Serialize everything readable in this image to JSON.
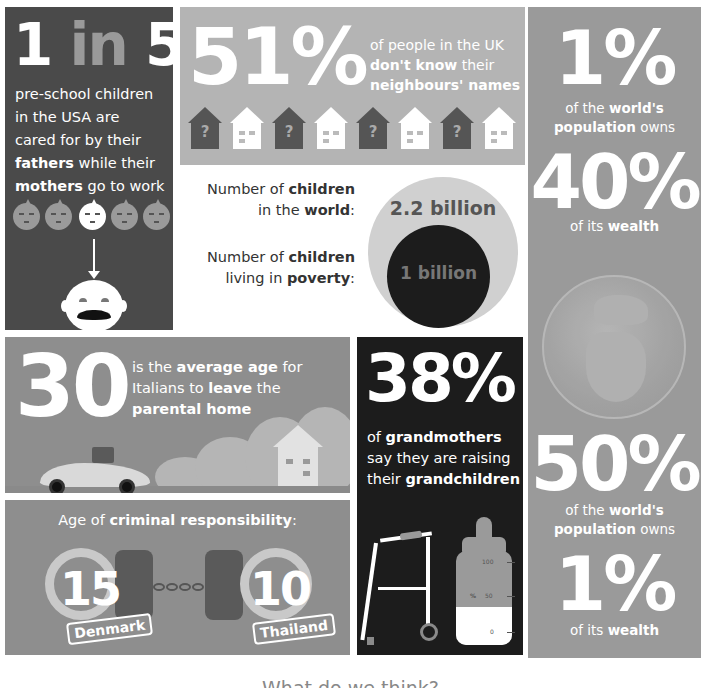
{
  "panel_1": {
    "stat_num1": "1",
    "stat_in": "in",
    "stat_num2": "5",
    "line1": "pre-school children",
    "line2": "in the USA are",
    "line3": "cared for by their",
    "bold_fathers": "fathers",
    "line4_rest": " while their",
    "bold_mothers": "mothers",
    "line5_rest": " go to work",
    "faces_total": 5,
    "highlighted_face_index": 2
  },
  "panel_2": {
    "stat": "51%",
    "line1": "of people in the UK",
    "bold_dont_know": "don't know",
    "line2_rest": " their",
    "bold_names": "neighbours' names",
    "question_mark": "?",
    "houses": [
      "unknown",
      "known",
      "unknown",
      "known",
      "unknown",
      "known",
      "unknown",
      "known"
    ]
  },
  "panel_3": {
    "label1_a": "Number of ",
    "label1_bold": "children",
    "label1_b": "in the ",
    "label1_bold2": "world",
    "label1_c": ":",
    "value1": "2.2 billion",
    "label2_a": "Number of ",
    "label2_bold": "children",
    "label2_b": "living in ",
    "label2_bold2": "poverty",
    "label2_c": ":",
    "value2": "1 billion"
  },
  "panel_4": {
    "stat_a": "1%",
    "cap_a1_pre": "of the ",
    "cap_a1_bold": "world's",
    "cap_a2_bold": "population",
    "cap_a2_post": " owns",
    "stat_b": "40%",
    "cap_b_pre": "of its ",
    "cap_b_bold": "wealth",
    "stat_c": "50%",
    "cap_c1_pre": "of the ",
    "cap_c1_bold": "world's",
    "cap_c2_bold": "population",
    "cap_c2_post": " owns",
    "stat_d": "1%",
    "cap_d_pre": "of its ",
    "cap_d_bold": "wealth"
  },
  "panel_5": {
    "stat": "30",
    "line1_pre": "is the ",
    "line1_bold": "average age",
    "line1_post": " for",
    "line2_pre": "Italians to ",
    "line2_bold": "leave",
    "line2_post": " the",
    "line3_bold": "parental home"
  },
  "panel_6": {
    "title_pre": "Age of ",
    "title_bold": "criminal responsibility",
    "title_post": ":",
    "left_age": "15",
    "left_country": "Denmark",
    "right_age": "10",
    "right_country": "Thailand"
  },
  "panel_7": {
    "stat": "38%",
    "line1_pre": "of ",
    "line1_bold": "grandmothers",
    "line2": "say they are raising",
    "line3_pre": "their ",
    "line3_bold": "grandchildren",
    "bottle_scale": {
      "top": "100",
      "mid": "50",
      "bottom": "0",
      "unit": "%"
    }
  },
  "footer": {
    "partial_heading": "What do we think?"
  },
  "colors": {
    "dark_panel": "#4a4a4a",
    "black_panel": "#1c1c1c",
    "mid_gray": "#9a9a9a",
    "light_gray": "#b4b4b4",
    "white": "#ffffff"
  }
}
